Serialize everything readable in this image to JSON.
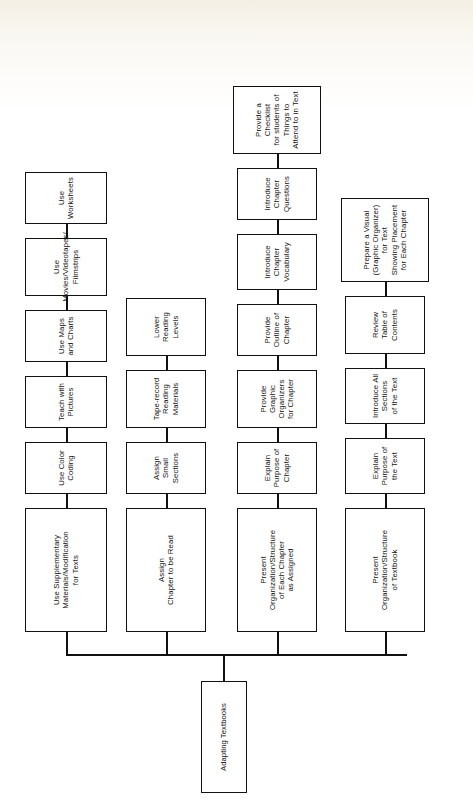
{
  "diagram": {
    "title": "Adapting Textbooks",
    "type": "tree",
    "orientation": "rotated-90-left",
    "root": {
      "label": "Adapting Textbooks"
    },
    "branches": [
      {
        "id": "branch-present-textbook",
        "label": "Present\nOrganization/Structure\nof Textbook",
        "children": [
          {
            "label": "Explain Purpose of the Text"
          },
          {
            "label": "Introduce All Sections\nof the Text"
          },
          {
            "label": "Review\nTable of Contents"
          },
          {
            "label": "Prepare a Visual\n(Graphic Organizer)\nfor Text\nShowing Placement\nfor Each Chapter"
          }
        ]
      },
      {
        "id": "branch-present-chapter",
        "label": "Present\nOrganization/Structure\nof Each Chapter\nas Assigned",
        "children": [
          {
            "label": "Explain Purpose of Chapter"
          },
          {
            "label": "Provide Graphic Organizers\nfor Chapter"
          },
          {
            "label": "Provide Outline of Chapter"
          },
          {
            "label": "Introduce Chapter\nVocabulary"
          },
          {
            "label": "Introduce Chapter Questions"
          },
          {
            "label": "Provide a Checklist\nfor students of Things to\nAttend to in Text"
          }
        ]
      },
      {
        "id": "branch-assign-chapter",
        "label": "Assign\nChapter to be Read",
        "children": [
          {
            "label": "Assign Small Sections"
          },
          {
            "label": "Tape-record Reading\nMaterials"
          },
          {
            "label": "Lower Reading\nLevels"
          }
        ]
      },
      {
        "id": "branch-use-supplementary",
        "label": "Use Supplementary\nMaterials/Modification\nfor Texts",
        "children": [
          {
            "label": "Use Color Coding"
          },
          {
            "label": "Teach with Pictures"
          },
          {
            "label": "Use Maps and Charts"
          },
          {
            "label": "Use Movies/Videotapes/\nFilmstrips"
          },
          {
            "label": "Use Worksheets"
          }
        ]
      }
    ],
    "caption": "",
    "colors": {
      "line": "#111111",
      "box_fill": "#ffffff",
      "text": "#111111",
      "paper": "#ffffff"
    }
  }
}
